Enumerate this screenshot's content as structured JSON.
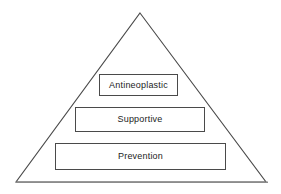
{
  "diagram": {
    "type": "pyramid",
    "title": "",
    "background_color": "#ffffff",
    "outline_color": "#4a4a4a",
    "baseline_color": "#8c8c8c",
    "text_color": "#1c1c1c",
    "triangle": {
      "apex": {
        "x": 140,
        "y": 13
      },
      "bottom_left": {
        "x": 16,
        "y": 182
      },
      "bottom_right": {
        "x": 266,
        "y": 182
      }
    },
    "baseline": {
      "x1": 16,
      "y1": 182,
      "x2": 268,
      "y2": 182
    },
    "tiers": [
      {
        "label": "Antineoplastic",
        "level": 1,
        "position": "top"
      },
      {
        "label": "Supportive",
        "level": 2,
        "position": "middle"
      },
      {
        "label": "Prevention",
        "level": 3,
        "position": "bottom"
      }
    ]
  }
}
